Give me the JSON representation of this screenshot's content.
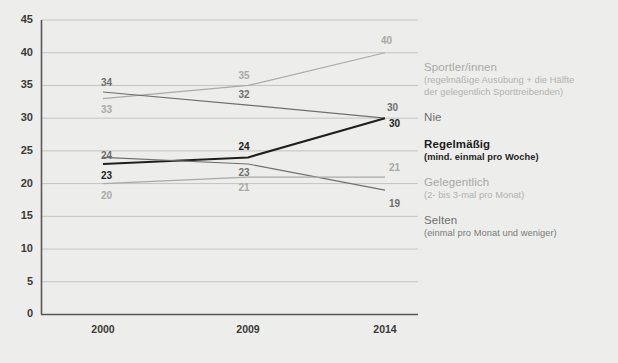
{
  "chart_data": {
    "type": "line",
    "title": "",
    "xlabel": "",
    "ylabel": "",
    "categories": [
      "2000",
      "2009",
      "2014"
    ],
    "x": [
      2000,
      2009,
      2014
    ],
    "ylim": [
      0,
      45
    ],
    "yticks": [
      0,
      5,
      10,
      15,
      20,
      25,
      30,
      35,
      40,
      45
    ],
    "ytick_labels": [
      "0",
      "5",
      "10",
      "15",
      "20",
      "25",
      "30",
      "35",
      "40",
      "45"
    ],
    "grid": true,
    "legend_position": "right",
    "series": [
      {
        "name": "Sportler/innen",
        "sub": "(regelmäßige Ausübung + die Hälfte der gelegentlich Sporttreibenden)",
        "values": [
          33,
          35,
          40
        ],
        "point_labels": [
          "33",
          "35",
          "40"
        ],
        "color": "#a9a9a6",
        "emphasis": "light"
      },
      {
        "name": "Nie",
        "sub": "",
        "values": [
          34,
          32,
          30
        ],
        "point_labels": [
          "34",
          "32",
          "30"
        ],
        "color": "#6f6f6d",
        "emphasis": "mid"
      },
      {
        "name": "Regelmäßig",
        "sub": "(mind. einmal pro Woche)",
        "values": [
          23,
          24,
          30
        ],
        "point_labels": [
          "23",
          "24",
          "30"
        ],
        "color": "#1e1e1e",
        "emphasis": "dark"
      },
      {
        "name": "Gelegentlich",
        "sub": "(2- bis 3-mal pro Monat)",
        "values": [
          24,
          23,
          19
        ],
        "point_labels": [
          "24",
          "23",
          "19"
        ],
        "color": "#6f6f6d",
        "emphasis": "mid"
      },
      {
        "name": "Selten",
        "sub": "(einmal pro Monat und weniger)",
        "values": [
          20,
          21,
          21
        ],
        "point_labels": [
          "20",
          "21",
          "21"
        ],
        "color": "#a9a9a6",
        "emphasis": "light"
      }
    ]
  },
  "legend": {
    "sportler": {
      "title": "Sportler/innen",
      "sub_line1": "(regelmäßige Ausübung + die Hälfte",
      "sub_line2": "der gelegentlich Sporttreibenden)"
    },
    "nie": {
      "title": "Nie",
      "sub": ""
    },
    "regelmaessig": {
      "title": "Regelmäßig",
      "sub": "(mind. einmal pro Woche)"
    },
    "gelegentlich": {
      "title": "Gelegentlich",
      "sub": "(2- bis 3-mal pro Monat)"
    },
    "selten": {
      "title": "Selten",
      "sub": "(einmal pro Monat und weniger)"
    }
  },
  "colors": {
    "background": "#ededeb",
    "axis": "#58585a",
    "gridline": "#c3c3c0",
    "light": "#a9a9a6",
    "mid": "#6f6f6d",
    "dark": "#1e1e1e"
  }
}
